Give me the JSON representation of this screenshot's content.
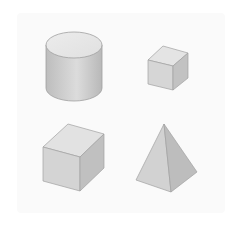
{
  "figure": {
    "description": "Four gray 3D geometric solids arranged in a 2x2 grid",
    "background": "#ffffff",
    "panel_color": "#fafafa",
    "shapes": [
      {
        "name": "Cylinder",
        "position": "top-left",
        "colors": {
          "top": "#e6e6e6",
          "side_light": "#d9d9d9",
          "side_dark": "#b5b5b5",
          "edge": "#9a9a9a"
        }
      },
      {
        "name": "Cube (small)",
        "position": "top-right",
        "colors": {
          "top": "#e4e4e4",
          "front": "#d6d6d6",
          "side": "#c2c2c2",
          "edge": "#9a9a9a"
        }
      },
      {
        "name": "Cube (large)",
        "position": "bottom-left",
        "colors": {
          "top": "#e2e2e2",
          "front": "#d4d4d4",
          "side": "#c0c0c0",
          "edge": "#9a9a9a"
        }
      },
      {
        "name": "Square pyramid",
        "position": "bottom-right",
        "colors": {
          "left_face": "#d2d2d2",
          "right_face": "#bdbdbd",
          "edge": "#9a9a9a"
        }
      }
    ]
  }
}
